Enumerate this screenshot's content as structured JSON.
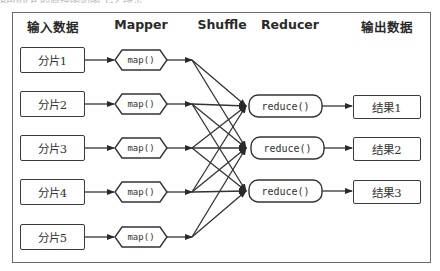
{
  "caption_clipped": "Reduce 的原理图如图 1-2 所示",
  "headers": {
    "input": "输入数据",
    "mapper": "Mapper",
    "shuffle": "Shuffle",
    "reducer": "Reducer",
    "output": "输出数据"
  },
  "splits": [
    "分片1",
    "分片2",
    "分片3",
    "分片4",
    "分片5"
  ],
  "maps": [
    "map()",
    "map()",
    "map()",
    "map()",
    "map()"
  ],
  "reducers": [
    "reduce()",
    "reduce()",
    "reduce()"
  ],
  "results": [
    "结果1",
    "结果2",
    "结果3"
  ],
  "colors": {
    "stroke": "#3a3a3a",
    "frame": "#6b6b6b",
    "text": "#333333"
  }
}
